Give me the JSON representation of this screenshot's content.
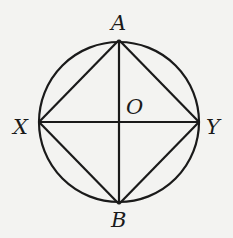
{
  "diagram": {
    "type": "geometry",
    "colors": {
      "stroke": "#1a1a1a",
      "background": "#f3f3f1"
    },
    "circle": {
      "center_label": "O",
      "cx": 119,
      "cy": 122,
      "r": 80
    },
    "points": [
      {
        "label": "A",
        "x": 119,
        "y": 40
      },
      {
        "label": "B",
        "x": 119,
        "y": 204
      },
      {
        "label": "X",
        "x": 39,
        "y": 122
      },
      {
        "label": "Y",
        "x": 199,
        "y": 122
      },
      {
        "label": "O",
        "x": 119,
        "y": 122
      }
    ],
    "segments": [
      "AB",
      "XY",
      "AX",
      "AY",
      "BX",
      "BY"
    ],
    "labels": {
      "A": "A",
      "B": "B",
      "X": "X",
      "Y": "Y",
      "O": "O"
    }
  }
}
